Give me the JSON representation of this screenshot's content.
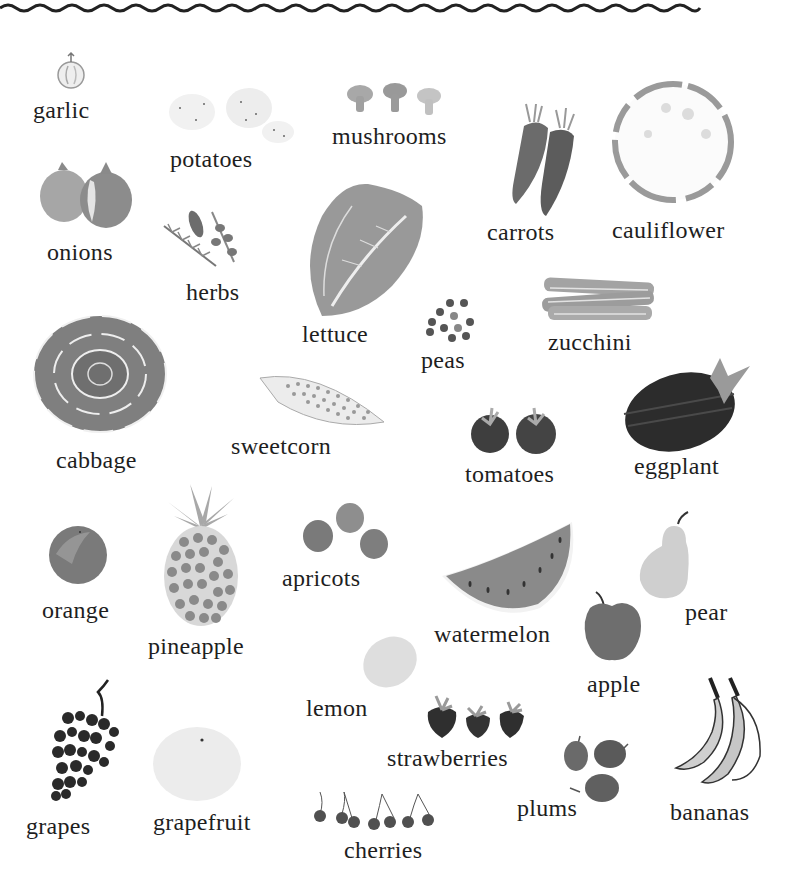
{
  "page": {
    "border": "wavy-line-top",
    "palette": {
      "ink": "#1e1e1e",
      "dark": "#3a3a3a",
      "mid": "#7a7a7a",
      "light": "#b8b8b8",
      "pale": "#e4e4e4"
    }
  },
  "vegetables": [
    {
      "label": "garlic",
      "icon": "garlic-icon"
    },
    {
      "label": "potatoes",
      "icon": "potatoes-icon"
    },
    {
      "label": "mushrooms",
      "icon": "mushrooms-icon"
    },
    {
      "label": "carrots",
      "icon": "carrots-icon"
    },
    {
      "label": "cauliflower",
      "icon": "cauliflower-icon"
    },
    {
      "label": "onions",
      "icon": "onions-icon"
    },
    {
      "label": "herbs",
      "icon": "herbs-icon"
    },
    {
      "label": "lettuce",
      "icon": "lettuce-icon"
    },
    {
      "label": "peas",
      "icon": "peas-icon"
    },
    {
      "label": "zucchini",
      "icon": "zucchini-icon"
    },
    {
      "label": "cabbage",
      "icon": "cabbage-icon"
    },
    {
      "label": "sweetcorn",
      "icon": "sweetcorn-icon"
    },
    {
      "label": "tomatoes",
      "icon": "tomatoes-icon"
    },
    {
      "label": "eggplant",
      "icon": "eggplant-icon"
    }
  ],
  "fruits": [
    {
      "label": "orange",
      "icon": "orange-icon"
    },
    {
      "label": "pineapple",
      "icon": "pineapple-icon"
    },
    {
      "label": "apricots",
      "icon": "apricots-icon"
    },
    {
      "label": "watermelon",
      "icon": "watermelon-icon"
    },
    {
      "label": "pear",
      "icon": "pear-icon"
    },
    {
      "label": "apple",
      "icon": "apple-icon"
    },
    {
      "label": "lemon",
      "icon": "lemon-icon"
    },
    {
      "label": "strawberries",
      "icon": "strawberries-icon"
    },
    {
      "label": "grapes",
      "icon": "grapes-icon"
    },
    {
      "label": "grapefruit",
      "icon": "grapefruit-icon"
    },
    {
      "label": "cherries",
      "icon": "cherries-icon"
    },
    {
      "label": "plums",
      "icon": "plums-icon"
    },
    {
      "label": "bananas",
      "icon": "bananas-icon"
    }
  ]
}
